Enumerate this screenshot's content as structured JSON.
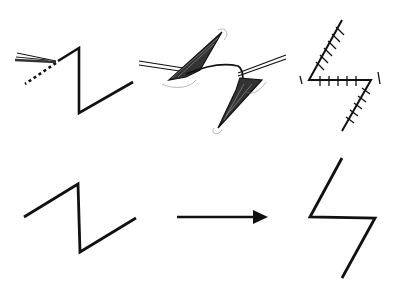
{
  "diagram": {
    "colors": {
      "ink": "#111111",
      "background": "#ffffff",
      "shading": "#555555"
    },
    "panels": [
      {
        "id": "incision",
        "label": "Z-shaped incision with scalpel and dotted guide line"
      },
      {
        "id": "flaps",
        "label": "Triangular flaps raised and transposed with hooks"
      },
      {
        "id": "sutured",
        "label": "Flaps sutured in transposed position"
      },
      {
        "id": "schematic-before",
        "label": "Z line before transposition"
      },
      {
        "id": "arrow",
        "label": "Transformation arrow"
      },
      {
        "id": "schematic-after",
        "label": "Rotated Z line after transposition"
      }
    ]
  }
}
